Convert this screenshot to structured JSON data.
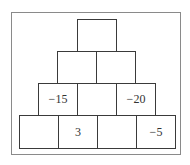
{
  "pyramid": {
    "rows": [
      [
        ""
      ],
      [
        "",
        ""
      ],
      [
        "−15",
        "",
        "−20"
      ],
      [
        "",
        "3",
        "",
        "−5"
      ]
    ]
  }
}
